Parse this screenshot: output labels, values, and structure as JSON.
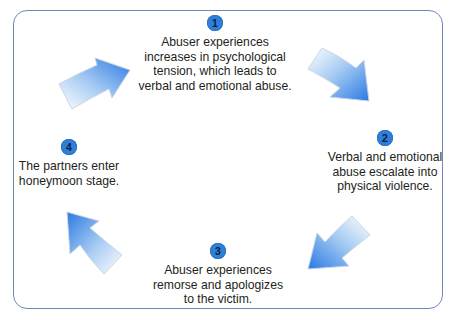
{
  "diagram": {
    "type": "cycle",
    "colors": {
      "frame_border": "#6f88b8",
      "badge_fill": "#2e7fd9",
      "arrow_dark": "#2a7ae2",
      "arrow_light": "#ffffff",
      "text": "#231f20"
    },
    "steps": [
      {
        "number": "1",
        "text": "Abuser experiences\nincreases in psychological\ntension, which leads to\nverbal and emotional abuse."
      },
      {
        "number": "2",
        "text": "Verbal and emotional\nabuse escalate into\nphysical violence."
      },
      {
        "number": "3",
        "text": "Abuser experiences\nremorse and apologizes\nto the victim."
      },
      {
        "number": "4",
        "text": "The partners enter\nhoneymoon stage."
      }
    ],
    "arrows": [
      {
        "from": "1",
        "to": "2",
        "direction": "down-right"
      },
      {
        "from": "2",
        "to": "3",
        "direction": "down-left"
      },
      {
        "from": "3",
        "to": "4",
        "direction": "up-left"
      },
      {
        "from": "4",
        "to": "1",
        "direction": "up-right"
      }
    ]
  }
}
